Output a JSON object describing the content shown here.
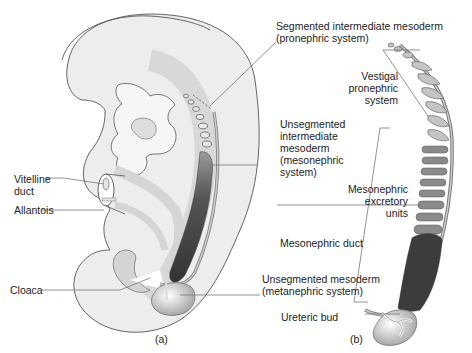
{
  "figure": {
    "panels": [
      {
        "id": "a",
        "label": "(a)"
      },
      {
        "id": "b",
        "label": "(b)"
      }
    ],
    "labels": {
      "segmented_intermediate": "Segmented intermediate mesoderm\n(pronephric system)",
      "vestigal_pronephric": "Vestigal\npronephric\nsystem",
      "unsegmented_intermediate": "Unsegmented\nintermediate\nmesoderm\n(mesonephric\nsystem)",
      "vitelline_duct": "Vitelline\nduct",
      "allantois": "Allantois",
      "mesonephric_excretory": "Mesonephric\nexcretory\nunits",
      "mesonephric_duct": "Mesonephric duct",
      "cloaca": "Cloaca",
      "unsegmented_mesoderm": "Unsegmented mesoderm\n(metanephric system)",
      "ureteric_bud": "Ureteric bud"
    },
    "colors": {
      "embryo_fill": "#eaeaea",
      "outline": "#555555",
      "mesonephric_dark": "#444444",
      "units_gray": "#8a8a8a",
      "pronephric_light": "#c4c4c4",
      "leader_line": "#777777"
    }
  }
}
